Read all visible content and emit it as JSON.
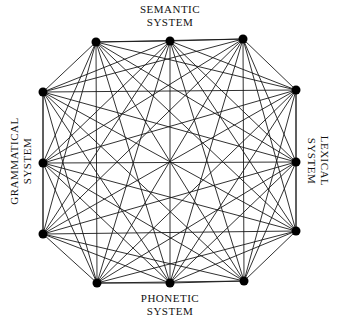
{
  "diagram": {
    "type": "complete-graph",
    "labels": {
      "top": {
        "line1": "SEMANTIC",
        "line2": "SYSTEM"
      },
      "bottom": {
        "line1": "PHONETIC",
        "line2": "SYSTEM"
      },
      "left": {
        "line1": "GRAMMATICAL",
        "line2": "SYSTEM"
      },
      "right": {
        "line1": "LEXICAL",
        "line2": "SYSTEM"
      }
    },
    "nodes": [
      {
        "id": "t1",
        "group": "semantic",
        "x": 96,
        "y": 42
      },
      {
        "id": "t2",
        "group": "semantic",
        "x": 170,
        "y": 41
      },
      {
        "id": "t3",
        "group": "semantic",
        "x": 243,
        "y": 39
      },
      {
        "id": "r1",
        "group": "lexical",
        "x": 296,
        "y": 90
      },
      {
        "id": "r2",
        "group": "lexical",
        "x": 296,
        "y": 162
      },
      {
        "id": "r3",
        "group": "lexical",
        "x": 296,
        "y": 231
      },
      {
        "id": "b3",
        "group": "phonetic",
        "x": 244,
        "y": 281
      },
      {
        "id": "b2",
        "group": "phonetic",
        "x": 170,
        "y": 283
      },
      {
        "id": "b1",
        "group": "phonetic",
        "x": 97,
        "y": 283
      },
      {
        "id": "l3",
        "group": "grammatical",
        "x": 43,
        "y": 234
      },
      {
        "id": "l2",
        "group": "grammatical",
        "x": 43,
        "y": 163
      },
      {
        "id": "l1",
        "group": "grammatical",
        "x": 43,
        "y": 92
      }
    ],
    "edges": "all-pairs",
    "node_radius": 4.5,
    "colors": {
      "node": "#000000",
      "edge": "#1a1a1a",
      "background": "#ffffff"
    }
  }
}
